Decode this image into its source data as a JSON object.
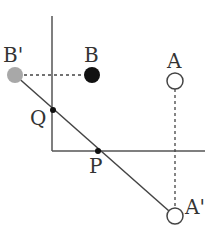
{
  "diagram": {
    "type": "geometry-reflection",
    "axes": {
      "vertical": {
        "x": 52,
        "y1": 16,
        "y2": 151
      },
      "horizontal": {
        "y": 151,
        "x1": 52,
        "x2": 205
      },
      "color": "#555555"
    },
    "points": {
      "B_prime": {
        "label": "B'",
        "x": 15,
        "y": 75,
        "fill": "#a8a8a8",
        "style": "filled"
      },
      "B": {
        "label": "B",
        "x": 92,
        "y": 75,
        "fill": "#111111",
        "style": "filled"
      },
      "A": {
        "label": "A",
        "x": 175,
        "y": 81,
        "fill": "#ffffff",
        "style": "open"
      },
      "A_prime": {
        "label": "A'",
        "x": 175,
        "y": 216,
        "fill": "#ffffff",
        "style": "open"
      },
      "Q": {
        "label": "Q",
        "x": 53,
        "y": 110,
        "fill": "#111111",
        "style": "dot"
      },
      "P": {
        "label": "P",
        "x": 98,
        "y": 151,
        "fill": "#111111",
        "style": "dot"
      }
    },
    "segments": [
      {
        "name": "line-b-prime-to-a-prime",
        "from": "B_prime",
        "to": "A_prime",
        "style": "solid"
      },
      {
        "name": "dashed-b-prime-to-b",
        "from": "B_prime",
        "to": "B",
        "style": "dashed"
      },
      {
        "name": "dashed-a-to-a-prime",
        "from": "A",
        "to": "A_prime",
        "style": "dashed"
      }
    ]
  },
  "labels": {
    "b_prime": "B'",
    "b": "B",
    "a": "A",
    "a_prime": "A'",
    "q": "Q",
    "p": "P"
  }
}
